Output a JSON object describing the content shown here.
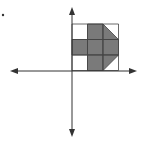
{
  "diagram": {
    "type": "coordinate-plane-figure",
    "colors": {
      "background": "#ffffff",
      "axis": "#333333",
      "grid_line": "#444444",
      "fill": "#7a7a7a"
    },
    "axes": {
      "origin": [
        72,
        71
      ],
      "x_axis": {
        "from": 10,
        "to": 137
      },
      "y_axis": {
        "from": 7,
        "to": 137
      }
    },
    "grid": {
      "rows": 3,
      "cols": 3,
      "cell_size": 15.5,
      "left": 72,
      "top": 24
    },
    "shaded_cells": [
      {
        "row": 0,
        "col": 1,
        "shape": "square"
      },
      {
        "row": 0,
        "col": 2,
        "shape": "triangle-lower-left"
      },
      {
        "row": 1,
        "col": 0,
        "shape": "square"
      },
      {
        "row": 1,
        "col": 1,
        "shape": "square"
      },
      {
        "row": 1,
        "col": 2,
        "shape": "square"
      },
      {
        "row": 2,
        "col": 1,
        "shape": "square"
      },
      {
        "row": 2,
        "col": 2,
        "shape": "triangle-upper-left"
      }
    ],
    "marker": {
      "x": 3,
      "y": 15,
      "symbol": "dot"
    }
  }
}
